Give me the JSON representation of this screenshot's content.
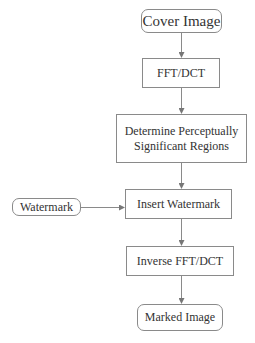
{
  "diagram": {
    "type": "flowchart",
    "nodes": {
      "cover": {
        "label": "Cover Image",
        "shape": "rounded"
      },
      "fft": {
        "label": "FFT/DCT",
        "shape": "rect"
      },
      "determine": {
        "label_line1": "Determine Perceptually",
        "label_line2": "Significant Regions",
        "shape": "rect"
      },
      "insert": {
        "label": "Insert Watermark",
        "shape": "rect"
      },
      "watermark": {
        "label": "Watermark",
        "shape": "rounded"
      },
      "inverse": {
        "label": "Inverse FFT/DCT",
        "shape": "rect"
      },
      "marked": {
        "label": "Marked Image",
        "shape": "rounded"
      }
    },
    "edges": [
      {
        "from": "Cover Image",
        "to": "FFT/DCT"
      },
      {
        "from": "FFT/DCT",
        "to": "Determine Perceptually Significant Regions"
      },
      {
        "from": "Determine Perceptually Significant Regions",
        "to": "Insert Watermark"
      },
      {
        "from": "Watermark",
        "to": "Insert Watermark"
      },
      {
        "from": "Insert Watermark",
        "to": "Inverse FFT/DCT"
      },
      {
        "from": "Inverse FFT/DCT",
        "to": "Marked Image"
      }
    ],
    "colors": {
      "stroke": "#8a8a8a",
      "text": "#333333",
      "background": "#ffffff"
    }
  }
}
